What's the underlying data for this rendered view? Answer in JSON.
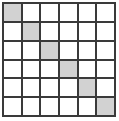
{
  "figure": {
    "type": "grid-diagram",
    "rows": 6,
    "columns": 6,
    "cell_count": 36,
    "shaded_cell_count": 6,
    "pattern": "main-diagonal"
  },
  "colors": {
    "shaded_cell": "#d2d2d2",
    "empty_cell": "#ffffff",
    "grid_line": "#3a3a3a",
    "background": "#ffffff"
  },
  "chart_data": {
    "type": "heatmap",
    "title": "",
    "xlabel": "",
    "ylabel": "",
    "grid": true,
    "categories": [
      "1",
      "2",
      "3",
      "4",
      "5",
      "6"
    ],
    "row_labels": [
      "1",
      "2",
      "3",
      "4",
      "5",
      "6"
    ],
    "column_labels": [
      "1",
      "2",
      "3",
      "4",
      "5",
      "6"
    ],
    "values": [
      [
        1,
        0,
        0,
        0,
        0,
        0
      ],
      [
        0,
        1,
        0,
        0,
        0,
        0
      ],
      [
        0,
        0,
        1,
        0,
        0,
        0
      ],
      [
        0,
        0,
        0,
        1,
        0,
        0
      ],
      [
        0,
        0,
        0,
        0,
        1,
        0
      ],
      [
        0,
        0,
        0,
        0,
        0,
        1
      ]
    ],
    "shaded_cells": [
      {
        "row": 1,
        "col": 1
      },
      {
        "row": 2,
        "col": 2
      },
      {
        "row": 3,
        "col": 3
      },
      {
        "row": 4,
        "col": 4
      },
      {
        "row": 5,
        "col": 5
      },
      {
        "row": 6,
        "col": 6
      }
    ],
    "legend": []
  }
}
